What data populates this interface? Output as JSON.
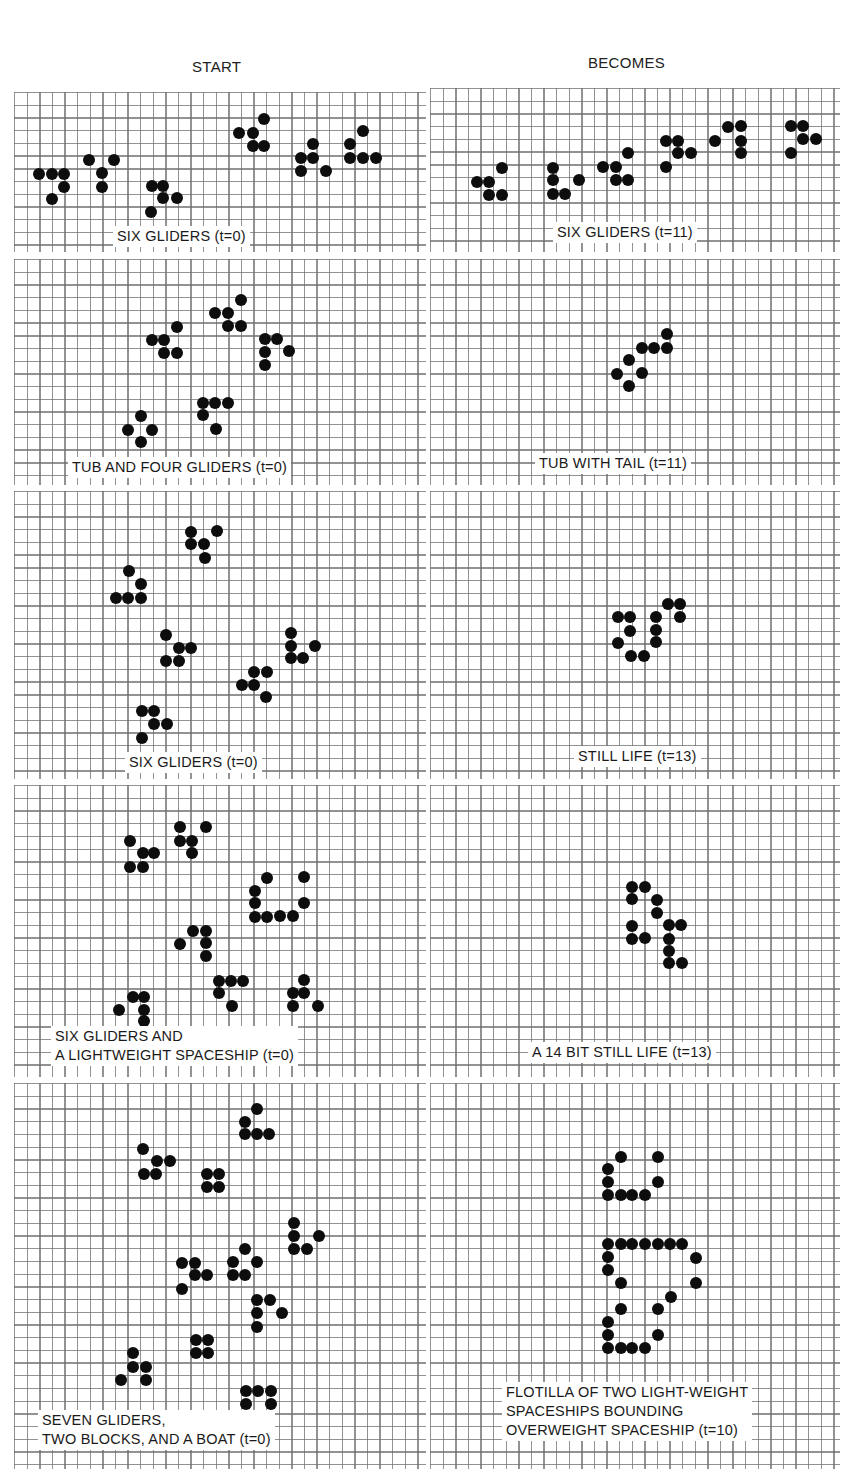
{
  "headers": {
    "start": "START",
    "becomes": "BECOMES"
  },
  "panels": [
    {
      "id": "p1",
      "label": "SIX GLIDERS (t=0)",
      "column": "start",
      "box": [
        14,
        92,
        412,
        160
      ],
      "label_pos": [
        113,
        226
      ],
      "dots": [
        [
          39,
          174
        ],
        [
          52,
          174
        ],
        [
          64,
          174
        ],
        [
          64,
          187
        ],
        [
          52,
          199
        ],
        [
          89,
          160
        ],
        [
          114,
          160
        ],
        [
          102,
          173
        ],
        [
          102,
          187
        ],
        [
          152,
          186
        ],
        [
          163,
          186
        ],
        [
          163,
          198
        ],
        [
          177,
          198
        ],
        [
          151,
          212
        ],
        [
          264,
          119
        ],
        [
          239,
          133
        ],
        [
          253,
          133
        ],
        [
          253,
          146
        ],
        [
          264,
          146
        ],
        [
          313,
          144
        ],
        [
          301,
          158
        ],
        [
          313,
          158
        ],
        [
          301,
          171
        ],
        [
          326,
          171
        ],
        [
          363,
          131
        ],
        [
          350,
          144
        ],
        [
          350,
          158
        ],
        [
          363,
          158
        ],
        [
          376,
          158
        ]
      ]
    },
    {
      "id": "p2",
      "label": "SIX GLIDERS (t=11)",
      "column": "becomes",
      "box": [
        430,
        88,
        410,
        164
      ],
      "label_pos": [
        553,
        222
      ],
      "dots": [
        [
          502,
          168
        ],
        [
          477,
          182
        ],
        [
          489,
          182
        ],
        [
          489,
          195
        ],
        [
          502,
          195
        ],
        [
          553,
          168
        ],
        [
          553,
          180
        ],
        [
          579,
          180
        ],
        [
          553,
          194
        ],
        [
          565,
          194
        ],
        [
          628,
          153
        ],
        [
          603,
          167
        ],
        [
          616,
          167
        ],
        [
          616,
          180
        ],
        [
          628,
          180
        ],
        [
          666,
          141
        ],
        [
          678,
          141
        ],
        [
          678,
          153
        ],
        [
          691,
          153
        ],
        [
          666,
          167
        ],
        [
          728,
          127
        ],
        [
          741,
          126
        ],
        [
          715,
          141
        ],
        [
          741,
          141
        ],
        [
          741,
          153
        ],
        [
          791,
          126
        ],
        [
          803,
          126
        ],
        [
          803,
          139
        ],
        [
          816,
          139
        ],
        [
          791,
          153
        ]
      ]
    },
    {
      "id": "p3",
      "label": "TUB AND FOUR GLIDERS (t=0)",
      "column": "start",
      "box": [
        14,
        259,
        412,
        226
      ],
      "label_pos": [
        68,
        457
      ],
      "dots": [
        [
          241,
          300
        ],
        [
          215,
          313
        ],
        [
          228,
          313
        ],
        [
          228,
          326
        ],
        [
          241,
          326
        ],
        [
          177,
          327
        ],
        [
          152,
          340
        ],
        [
          164,
          340
        ],
        [
          164,
          353
        ],
        [
          177,
          353
        ],
        [
          265,
          339
        ],
        [
          277,
          339
        ],
        [
          265,
          352
        ],
        [
          289,
          351
        ],
        [
          265,
          365
        ],
        [
          203,
          403
        ],
        [
          215,
          403
        ],
        [
          228,
          403
        ],
        [
          203,
          415
        ],
        [
          216,
          429
        ],
        [
          141,
          416
        ],
        [
          128,
          430
        ],
        [
          152,
          430
        ],
        [
          141,
          442
        ]
      ]
    },
    {
      "id": "p4",
      "label": "TUB WITH TAIL (t=11)",
      "column": "becomes",
      "box": [
        430,
        259,
        410,
        226
      ],
      "label_pos": [
        535,
        453
      ],
      "dots": [
        [
          667,
          334
        ],
        [
          642,
          348
        ],
        [
          654,
          348
        ],
        [
          667,
          348
        ],
        [
          629,
          360
        ],
        [
          617,
          374
        ],
        [
          642,
          373
        ],
        [
          629,
          386
        ]
      ]
    },
    {
      "id": "p5",
      "label": "SIX GLIDERS (t=0)",
      "column": "start",
      "box": [
        14,
        491,
        412,
        288
      ],
      "label_pos": [
        125,
        752
      ],
      "dots": [
        [
          191,
          532
        ],
        [
          217,
          531
        ],
        [
          191,
          544
        ],
        [
          204,
          544
        ],
        [
          205,
          558
        ],
        [
          129,
          571
        ],
        [
          141,
          584
        ],
        [
          116,
          598
        ],
        [
          128,
          598
        ],
        [
          141,
          598
        ],
        [
          166,
          635
        ],
        [
          179,
          648
        ],
        [
          191,
          648
        ],
        [
          166,
          661
        ],
        [
          179,
          661
        ],
        [
          291,
          633
        ],
        [
          291,
          646
        ],
        [
          315,
          646
        ],
        [
          291,
          658
        ],
        [
          303,
          658
        ],
        [
          254,
          672
        ],
        [
          267,
          672
        ],
        [
          242,
          685
        ],
        [
          254,
          685
        ],
        [
          266,
          697
        ],
        [
          142,
          711
        ],
        [
          154,
          711
        ],
        [
          154,
          724
        ],
        [
          167,
          724
        ],
        [
          142,
          738
        ]
      ]
    },
    {
      "id": "p6",
      "label": "STILL LIFE (t=13)",
      "column": "becomes",
      "box": [
        430,
        491,
        410,
        288
      ],
      "label_pos": [
        574,
        746
      ],
      "dots": [
        [
          668,
          604
        ],
        [
          680,
          604
        ],
        [
          618,
          617
        ],
        [
          630,
          617
        ],
        [
          656,
          617
        ],
        [
          680,
          617
        ],
        [
          630,
          631
        ],
        [
          656,
          630
        ],
        [
          618,
          643
        ],
        [
          656,
          642
        ],
        [
          631,
          656
        ],
        [
          644,
          656
        ]
      ]
    },
    {
      "id": "p7",
      "label": "SIX GLIDERS AND\nA LIGHTWEIGHT SPACESHIP (t=0)",
      "column": "start",
      "box": [
        14,
        785,
        412,
        292
      ],
      "label_pos": [
        51,
        1026
      ],
      "dots": [
        [
          130,
          841
        ],
        [
          143,
          853
        ],
        [
          154,
          853
        ],
        [
          130,
          867
        ],
        [
          143,
          867
        ],
        [
          180,
          827
        ],
        [
          206,
          827
        ],
        [
          180,
          841
        ],
        [
          192,
          841
        ],
        [
          192,
          853
        ],
        [
          267,
          878
        ],
        [
          304,
          877
        ],
        [
          255,
          891
        ],
        [
          255,
          903
        ],
        [
          304,
          903
        ],
        [
          255,
          917
        ],
        [
          267,
          917
        ],
        [
          280,
          916
        ],
        [
          293,
          916
        ],
        [
          193,
          931
        ],
        [
          206,
          931
        ],
        [
          180,
          944
        ],
        [
          206,
          943
        ],
        [
          206,
          956
        ],
        [
          219,
          981
        ],
        [
          231,
          981
        ],
        [
          243,
          981
        ],
        [
          219,
          993
        ],
        [
          232,
          1006
        ],
        [
          304,
          980
        ],
        [
          293,
          993
        ],
        [
          304,
          993
        ],
        [
          293,
          1006
        ],
        [
          318,
          1006
        ],
        [
          133,
          997
        ],
        [
          144,
          997
        ],
        [
          119,
          1010
        ],
        [
          144,
          1010
        ],
        [
          144,
          1021
        ]
      ]
    },
    {
      "id": "p8",
      "label": "A 14 BIT STILL LIFE (t=13)",
      "column": "becomes",
      "box": [
        430,
        785,
        410,
        292
      ],
      "label_pos": [
        528,
        1042
      ],
      "dots": [
        [
          632,
          887
        ],
        [
          645,
          887
        ],
        [
          632,
          899
        ],
        [
          657,
          900
        ],
        [
          657,
          913
        ],
        [
          669,
          925
        ],
        [
          681,
          925
        ],
        [
          632,
          926
        ],
        [
          632,
          939
        ],
        [
          645,
          938
        ],
        [
          669,
          939
        ],
        [
          669,
          951
        ],
        [
          669,
          963
        ],
        [
          682,
          963
        ]
      ]
    },
    {
      "id": "p9",
      "label": "SEVEN GLIDERS,\nTWO BLOCKS, AND A BOAT (t=0)",
      "column": "start",
      "box": [
        14,
        1083,
        412,
        386
      ],
      "label_pos": [
        38,
        1410
      ],
      "dots": [
        [
          257,
          1109
        ],
        [
          245,
          1122
        ],
        [
          245,
          1134
        ],
        [
          257,
          1134
        ],
        [
          269,
          1134
        ],
        [
          143,
          1149
        ],
        [
          157,
          1161
        ],
        [
          170,
          1161
        ],
        [
          144,
          1174
        ],
        [
          156,
          1174
        ],
        [
          207,
          1174
        ],
        [
          219,
          1174
        ],
        [
          207,
          1187
        ],
        [
          219,
          1187
        ],
        [
          294,
          1223
        ],
        [
          294,
          1236
        ],
        [
          319,
          1236
        ],
        [
          294,
          1249
        ],
        [
          307,
          1249
        ],
        [
          182,
          1263
        ],
        [
          195,
          1263
        ],
        [
          195,
          1275
        ],
        [
          207,
          1275
        ],
        [
          182,
          1289
        ],
        [
          245,
          1249
        ],
        [
          233,
          1262
        ],
        [
          257,
          1262
        ],
        [
          233,
          1275
        ],
        [
          245,
          1275
        ],
        [
          257,
          1300
        ],
        [
          270,
          1300
        ],
        [
          257,
          1313
        ],
        [
          282,
          1313
        ],
        [
          257,
          1327
        ],
        [
          196,
          1340
        ],
        [
          208,
          1340
        ],
        [
          196,
          1353
        ],
        [
          208,
          1353
        ],
        [
          133,
          1353
        ],
        [
          133,
          1367
        ],
        [
          146,
          1367
        ],
        [
          121,
          1380
        ],
        [
          146,
          1380
        ],
        [
          246,
          1391
        ],
        [
          258,
          1391
        ],
        [
          271,
          1391
        ],
        [
          246,
          1404
        ],
        [
          271,
          1404
        ],
        [
          246,
          1417
        ]
      ]
    },
    {
      "id": "p10",
      "label": "FLOTILLA OF TWO LIGHT-WEIGHT\nSPACESHIPS BOUNDING\nOVERWEIGHT SPACESHIP (t=10)",
      "column": "becomes",
      "box": [
        430,
        1083,
        410,
        386
      ],
      "label_pos": [
        502,
        1382
      ],
      "dots": [
        [
          621,
          1157
        ],
        [
          658,
          1157
        ],
        [
          608,
          1169
        ],
        [
          608,
          1182
        ],
        [
          658,
          1182
        ],
        [
          608,
          1195
        ],
        [
          621,
          1195
        ],
        [
          632,
          1195
        ],
        [
          645,
          1195
        ],
        [
          608,
          1244
        ],
        [
          621,
          1244
        ],
        [
          632,
          1244
        ],
        [
          645,
          1244
        ],
        [
          658,
          1244
        ],
        [
          670,
          1244
        ],
        [
          682,
          1244
        ],
        [
          608,
          1257
        ],
        [
          696,
          1258
        ],
        [
          608,
          1270
        ],
        [
          621,
          1283
        ],
        [
          696,
          1283
        ],
        [
          671,
          1297
        ],
        [
          621,
          1309
        ],
        [
          658,
          1309
        ],
        [
          608,
          1322
        ],
        [
          608,
          1335
        ],
        [
          658,
          1335
        ],
        [
          608,
          1348
        ],
        [
          621,
          1348
        ],
        [
          632,
          1348
        ],
        [
          645,
          1348
        ]
      ]
    }
  ]
}
